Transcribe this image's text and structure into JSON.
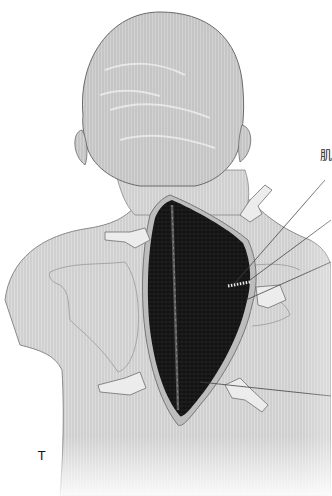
{
  "figure": {
    "colors": {
      "background": "#ffffff",
      "skin": "#d9d9d9",
      "skin_dark": "#9a9a9a",
      "wound": "#111111",
      "outline": "#555555",
      "leader_line": "#444444"
    },
    "labels": {
      "top_right": "肌",
      "bottom_left": "T"
    },
    "leader_lines": 5
  }
}
